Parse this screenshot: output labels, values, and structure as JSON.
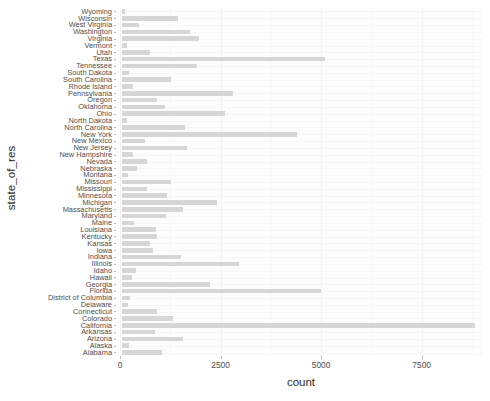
{
  "chart_data": {
    "type": "bar",
    "orientation": "horizontal",
    "title": "",
    "xlabel": "count",
    "ylabel": "state_of_res",
    "xlim": [
      0,
      9000
    ],
    "ylim": null,
    "grid": true,
    "legend": false,
    "legend_position": "none",
    "bar_color": "#d6d6d6",
    "panel_color": "#fdfdfd",
    "xticks": [
      0,
      2500,
      5000,
      7500
    ],
    "xtick_labels": [
      "0",
      "2500",
      "5000",
      "7500"
    ],
    "categories": [
      "Wyoming",
      "Wisconsin",
      "West Virginia",
      "Washington",
      "Virginia",
      "Vermont",
      "Utah",
      "Texas",
      "Tennessee",
      "South Dakota",
      "South Carolina",
      "Rhode Island",
      "Pennsylvania",
      "Oregon",
      "Oklahoma",
      "Ohio",
      "North Dakota",
      "North Carolina",
      "New York",
      "New Mexico",
      "New Jersey",
      "New Hampshire",
      "Nevada",
      "Nebraska",
      "Montana",
      "Missouri",
      "Mississippi",
      "Minnesota",
      "Michigan",
      "Massachusetts",
      "Maryland",
      "Maine",
      "Louisiana",
      "Kentucky",
      "Kansas",
      "Iowa",
      "Indiana",
      "Illinois",
      "Idaho",
      "Hawaii",
      "Georgia",
      "Florida",
      "District of Columbia",
      "Delaware",
      "Connecticut",
      "Colorado",
      "California",
      "Arkansas",
      "Arizona",
      "Alaska",
      "Alabama"
    ],
    "values": [
      90,
      1400,
      430,
      1700,
      1930,
      130,
      700,
      5050,
      1880,
      180,
      1230,
      280,
      2760,
      890,
      1070,
      2570,
      130,
      1590,
      4370,
      580,
      1620,
      290,
      640,
      390,
      170,
      1240,
      640,
      1140,
      2380,
      1530,
      1100,
      300,
      860,
      880,
      700,
      790,
      1470,
      2930,
      350,
      270,
      2210,
      4960,
      220,
      150,
      880,
      1270,
      8800,
      840,
      1520,
      190,
      1000
    ]
  }
}
